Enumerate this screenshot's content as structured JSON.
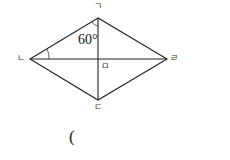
{
  "figure": {
    "shape": "rhombus",
    "vertices": {
      "top": {
        "label": "ㄱ"
      },
      "left": {
        "label": "ㄴ"
      },
      "bottom": {
        "label": "ㄷ"
      },
      "right": {
        "label": "ㄹ"
      }
    },
    "center_label": "ㅁ",
    "angle_label": "60°",
    "answer_paren": "("
  }
}
